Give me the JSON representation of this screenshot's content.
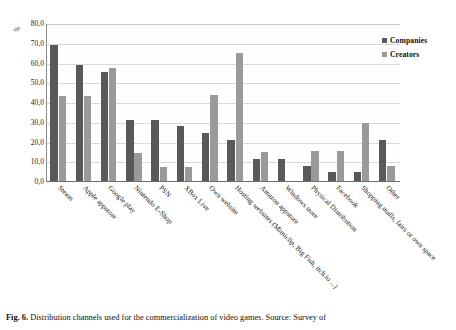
{
  "figure": {
    "caption_figno": "Fig. 6.",
    "caption_text": "Distribution channels used for the commercialization of video games. Source: Survey of"
  },
  "legend": {
    "position": "right",
    "items": [
      {
        "label": "Companies",
        "color": "#595959"
      },
      {
        "label": "Creators",
        "color": "#9a9a9a"
      }
    ]
  },
  "axis": {
    "y_unit_label": "%",
    "y_ticks": [
      "80,0",
      "70,0",
      "60,0",
      "50,0",
      "40,0",
      "30,0",
      "20,0",
      "10,0",
      "0,0"
    ]
  },
  "chart_data": {
    "type": "bar",
    "title": "",
    "xlabel": "",
    "ylabel": "%",
    "ylim": [
      0,
      80
    ],
    "ytick_step": 10,
    "grid": true,
    "legend_position": "right",
    "categories": [
      "Steam",
      "Apple appstore",
      "Google play",
      "Nintendo E-Shop",
      "PSN",
      "XBox Live",
      "Own website",
      "Hosting websites (Mimiclip, Big Fish, itch.io ...)",
      "Amazon appstore",
      "Windows store",
      "Physical Distribution",
      "Facebook",
      "Shopping malls, fairs or own space",
      "Other"
    ],
    "series": [
      {
        "name": "Companies",
        "color": "#595959",
        "values": [
          69.0,
          58.5,
          55.0,
          31.0,
          31.0,
          27.8,
          24.5,
          20.8,
          11.0,
          11.0,
          7.5,
          4.5,
          4.5,
          21.0
        ]
      },
      {
        "name": "Creators",
        "color": "#9a9a9a",
        "values": [
          43.0,
          43.0,
          57.0,
          14.0,
          7.0,
          7.0,
          43.5,
          65.0,
          14.5,
          0.0,
          15.0,
          15.0,
          29.5,
          7.5
        ]
      }
    ]
  }
}
